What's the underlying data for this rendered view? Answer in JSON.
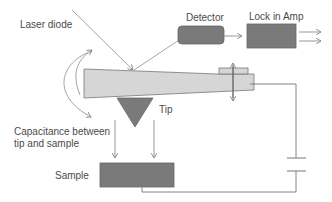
{
  "diagram": {
    "labels": {
      "laser": "Laser diode",
      "detector": "Detector",
      "lockin": "Lock in Amp",
      "tip": "Tip",
      "capacitance_line1": "Capacitance between",
      "capacitance_line2": "tip and sample",
      "sample": "Sample"
    },
    "colors": {
      "cantilever_fill": "#d6d6d6",
      "dark_fill": "#7a7a7a",
      "line": "#8a8a8a",
      "text": "#4a4a4a"
    },
    "nodes": [
      {
        "id": "laser",
        "label": "Laser diode"
      },
      {
        "id": "cantilever",
        "label": ""
      },
      {
        "id": "tip",
        "label": "Tip"
      },
      {
        "id": "detector",
        "label": "Detector"
      },
      {
        "id": "lockin",
        "label": "Lock in Amp"
      },
      {
        "id": "sample",
        "label": "Sample"
      },
      {
        "id": "capacitor",
        "label": ""
      }
    ],
    "edges": [
      {
        "from": "laser",
        "to": "cantilever",
        "type": "beam"
      },
      {
        "from": "cantilever",
        "to": "detector",
        "type": "reflected beam"
      },
      {
        "from": "detector",
        "to": "lockin",
        "type": "arrow"
      },
      {
        "from": "lockin",
        "to": "output",
        "type": "double arrow"
      },
      {
        "from": "cantilever",
        "to": "capacitor",
        "type": "wire"
      },
      {
        "from": "capacitor",
        "to": "sample",
        "type": "wire"
      },
      {
        "from": "tip",
        "to": "sample",
        "type": "field arrows"
      }
    ]
  }
}
